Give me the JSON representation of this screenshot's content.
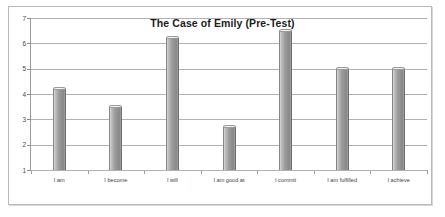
{
  "chart_data": {
    "type": "bar",
    "title": "The Case of Emily (Pre-Test)",
    "xlabel": "",
    "ylabel": "",
    "categories": [
      "I am",
      "I become",
      "I will",
      "I am good at",
      "I commit",
      "I am fulfilled",
      "I achieve"
    ],
    "values": [
      4.2,
      3.5,
      6.2,
      2.7,
      6.5,
      5.0,
      5.0
    ],
    "ylim": [
      1,
      7
    ],
    "yticks": [
      1,
      2,
      3,
      4,
      5,
      6,
      7
    ],
    "ytick_labels": [
      "1",
      "2",
      "3",
      "4",
      "5",
      "6",
      "7"
    ],
    "grid": true,
    "legend": false,
    "legend_position": "none",
    "series": [
      {
        "name": "Pre-Test",
        "values": [
          4.2,
          3.5,
          6.2,
          2.7,
          6.5,
          5.0,
          5.0
        ]
      }
    ],
    "colors": {
      "bar_light": "#d6d6d6",
      "bar_dark": "#8a8a8a",
      "gridline": "#b2b2b2",
      "axis": "#9c9c9c",
      "text": "#3d3d3d",
      "title": "#1c1c1c",
      "frame": "#b9b9b9",
      "background": "#ffffff"
    }
  }
}
